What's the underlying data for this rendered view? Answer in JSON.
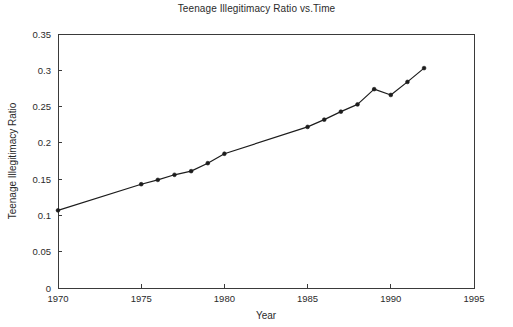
{
  "chart_data": {
    "type": "line",
    "title": "Teenage Illegitimacy Ratio vs.Time",
    "xlabel": "Year",
    "ylabel": "Teenage Illegitimacy Ratio",
    "xlim": [
      1970,
      1995
    ],
    "ylim": [
      0,
      0.35
    ],
    "xticks": [
      1970,
      1975,
      1980,
      1985,
      1990,
      1995
    ],
    "xtick_labels": [
      "1970",
      "1975",
      "1980",
      "1985",
      "1990",
      "1995"
    ],
    "yticks": [
      0,
      0.05,
      0.1,
      0.15,
      0.2,
      0.25,
      0.3,
      0.35
    ],
    "ytick_labels": [
      "0",
      "0.05",
      "0.1",
      "0.15",
      "0.2",
      "0.25",
      "0.3",
      "0.35"
    ],
    "grid": false,
    "legend": null,
    "marker": "point",
    "line_color": "#1c1c1c",
    "x": [
      1970,
      1975,
      1976,
      1977,
      1978,
      1979,
      1980,
      1985,
      1986,
      1987,
      1988,
      1989,
      1990,
      1991,
      1992
    ],
    "values": [
      0.107,
      0.143,
      0.149,
      0.156,
      0.161,
      0.172,
      0.185,
      0.222,
      0.232,
      0.243,
      0.253,
      0.274,
      0.266,
      0.284,
      0.303
    ],
    "series": [
      {
        "name": "Teenage Illegitimacy Ratio",
        "values": [
          0.107,
          0.143,
          0.149,
          0.156,
          0.161,
          0.172,
          0.185,
          0.222,
          0.232,
          0.243,
          0.253,
          0.274,
          0.266,
          0.284,
          0.303
        ]
      }
    ]
  },
  "plot_geometry": {
    "left": 58,
    "right": 474,
    "top": 34,
    "bottom": 288
  }
}
